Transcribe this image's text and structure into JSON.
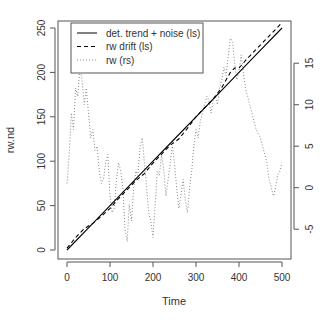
{
  "chart_data": {
    "type": "line",
    "title": "",
    "xlabel": "Time",
    "ylabel": "rw.nd",
    "ylabel_right": "",
    "xlim": [
      0,
      500
    ],
    "ylim": [
      0,
      250
    ],
    "ylim_right": [
      -7.5,
      18.5
    ],
    "x_ticks": [
      0,
      100,
      200,
      300,
      400,
      500
    ],
    "y_ticks": [
      0,
      50,
      100,
      150,
      200,
      250
    ],
    "y_ticks_right": [
      -5,
      0,
      5,
      10,
      15
    ],
    "grid": false,
    "legend_position": "top-left",
    "legend": [
      {
        "label": "det. trend + noise (ls)",
        "style": "solid"
      },
      {
        "label": "rw drift (ls)",
        "style": "dashed"
      },
      {
        "label": "rw (rs)",
        "style": "dotted"
      }
    ],
    "series": [
      {
        "name": "det. trend + noise (ls)",
        "axis": "left",
        "style": "solid",
        "color": "#000000",
        "x": [
          0,
          50,
          100,
          150,
          200,
          250,
          300,
          350,
          400,
          450,
          500
        ],
        "values": [
          0,
          25,
          50,
          75,
          100,
          125,
          150,
          175,
          200,
          225,
          250
        ]
      },
      {
        "name": "rw drift (ls)",
        "axis": "left",
        "style": "dashed",
        "color": "#000000",
        "x": [
          0,
          20,
          40,
          60,
          80,
          100,
          120,
          140,
          160,
          180,
          200,
          220,
          240,
          260,
          280,
          300,
          320,
          340,
          360,
          380,
          390,
          400,
          420,
          440,
          460,
          480,
          500
        ],
        "values": [
          2,
          14,
          24,
          30,
          38,
          47,
          58,
          68,
          78,
          86,
          98,
          108,
          118,
          125,
          137,
          150,
          160,
          170,
          183,
          200,
          205,
          205,
          216,
          226,
          236,
          246,
          256
        ]
      },
      {
        "name": "rw (rs)",
        "axis": "right",
        "style": "dotted",
        "color": "#888888",
        "x": [
          0,
          5,
          10,
          15,
          20,
          25,
          30,
          35,
          40,
          45,
          50,
          55,
          60,
          65,
          70,
          75,
          80,
          85,
          90,
          95,
          100,
          105,
          110,
          115,
          120,
          125,
          130,
          135,
          140,
          145,
          150,
          155,
          160,
          165,
          170,
          175,
          180,
          185,
          190,
          195,
          200,
          205,
          210,
          215,
          220,
          225,
          230,
          235,
          240,
          245,
          250,
          255,
          260,
          265,
          270,
          275,
          280,
          285,
          290,
          295,
          300,
          305,
          310,
          315,
          320,
          325,
          330,
          335,
          340,
          345,
          350,
          355,
          360,
          365,
          370,
          375,
          380,
          385,
          390,
          395,
          400,
          405,
          410,
          415,
          420,
          425,
          430,
          435,
          440,
          445,
          450,
          455,
          460,
          465,
          470,
          475,
          480,
          485,
          490,
          495,
          500
        ],
        "values": [
          0.5,
          4,
          9,
          7,
          12,
          11,
          14.5,
          13,
          10,
          12,
          9,
          6,
          7,
          4.5,
          5,
          2,
          0.5,
          1,
          3,
          4,
          -1,
          -3,
          -2.5,
          1,
          3,
          2,
          0,
          -5,
          -6.5,
          -2,
          -4,
          0,
          2,
          1.5,
          5,
          6,
          3,
          0,
          -3,
          -4,
          -6,
          -2,
          2,
          1.5,
          4,
          2,
          -1,
          1,
          3,
          5,
          3,
          0,
          -2.5,
          -1,
          1,
          -1.5,
          -3,
          0,
          2,
          5,
          7,
          6,
          8,
          9,
          10,
          11,
          10.5,
          9,
          10.5,
          11,
          10,
          12,
          13,
          14.5,
          13.5,
          16,
          18,
          17.5,
          15,
          13,
          14,
          16,
          14,
          12,
          11,
          10,
          9,
          8,
          7,
          6.5,
          6,
          5,
          4,
          3,
          1,
          0,
          -1,
          0,
          1.5,
          2,
          3
        ]
      }
    ]
  }
}
